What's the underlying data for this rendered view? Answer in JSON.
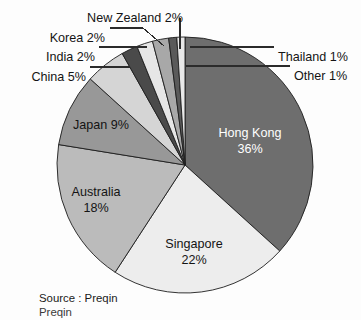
{
  "chart_data": {
    "type": "pie",
    "title": "",
    "subtitle": "",
    "xlabel": "",
    "ylabel": "",
    "legend_position": "none",
    "grid": false,
    "units": "percent",
    "start_angle_deg": 0,
    "direction": "clockwise",
    "categories": [
      "Hong Kong",
      "Singapore",
      "Australia",
      "Japan",
      "China",
      "India",
      "Korea",
      "New Zealand",
      "Thailand",
      "Other"
    ],
    "values": [
      36,
      22,
      18,
      9,
      5,
      2,
      2,
      2,
      1,
      1
    ],
    "total": 98,
    "slices": [
      {
        "name": "Hong Kong",
        "value": 36,
        "value_label": "36%",
        "label_line1": "Hong Kong",
        "label_line2": "36%",
        "color": "#6e6e6e",
        "label_placement": "inside",
        "label_color": "light"
      },
      {
        "name": "Singapore",
        "value": 22,
        "value_label": "22%",
        "label_line1": "Singapore",
        "label_line2": "22%",
        "color": "#ededed",
        "label_placement": "inside",
        "label_color": "dark"
      },
      {
        "name": "Australia",
        "value": 18,
        "value_label": "18%",
        "label_line1": "Australia",
        "label_line2": "18%",
        "color": "#bbbbbb",
        "label_placement": "inside",
        "label_color": "dark"
      },
      {
        "name": "Japan",
        "value": 9,
        "value_label": "9%",
        "label_line1": "Japan 9%",
        "label_line2": "",
        "color": "#989898",
        "label_placement": "inside",
        "label_color": "dark"
      },
      {
        "name": "China",
        "value": 5,
        "value_label": "5%",
        "label_line1": "China 5%",
        "label_line2": "",
        "color": "#d5d5d5",
        "label_placement": "callout",
        "label_color": "dark"
      },
      {
        "name": "India",
        "value": 2,
        "value_label": "2%",
        "label_line1": "India 2%",
        "label_line2": "",
        "color": "#4a4a4a",
        "label_placement": "callout",
        "label_color": "dark"
      },
      {
        "name": "Korea",
        "value": 2,
        "value_label": "2%",
        "label_line1": "Korea 2%",
        "label_line2": "",
        "color": "#e6e6e6",
        "label_placement": "callout",
        "label_color": "dark"
      },
      {
        "name": "New Zealand",
        "value": 2,
        "value_label": "2%",
        "label_line1": "New Zealand 2%",
        "label_line2": "",
        "color": "#a8a8a8",
        "label_placement": "callout",
        "label_color": "dark"
      },
      {
        "name": "Thailand",
        "value": 1,
        "value_label": "1%",
        "label_line1": "Thailand 1%",
        "label_line2": "",
        "color": "#5a5a5a",
        "label_placement": "callout",
        "label_color": "dark"
      },
      {
        "name": "Other",
        "value": 1,
        "value_label": "1%",
        "label_line1": "Other 1%",
        "label_line2": "",
        "color": "#e9e9e9",
        "label_placement": "callout",
        "label_color": "dark"
      }
    ],
    "callouts": [
      {
        "name": "New Zealand",
        "text": "New Zealand 2%",
        "text_x": 183,
        "text_y": 13,
        "anchor": "end",
        "line": [
          [
            180,
            18
          ],
          [
            180,
            49
          ]
        ]
      },
      {
        "name": "Korea",
        "text": "Korea 2%",
        "text_x": 105,
        "text_y": 33,
        "anchor": "end",
        "line": [
          [
            110,
            28
          ],
          [
            143,
            28
          ],
          [
            164,
            46
          ]
        ]
      },
      {
        "name": "India",
        "text": "India 2%",
        "text_x": 95,
        "text_y": 52,
        "anchor": "end",
        "line": [
          [
            99,
            47
          ],
          [
            147,
            47
          ]
        ]
      },
      {
        "name": "China",
        "text": "China 5%",
        "text_x": 86,
        "text_y": 72,
        "anchor": "end",
        "line": [
          [
            90,
            67
          ],
          [
            130,
            67
          ]
        ]
      },
      {
        "name": "Thailand",
        "text": "Thailand 1%",
        "text_x": 278,
        "text_y": 52,
        "anchor": "start",
        "line": [
          [
            274,
            47
          ],
          [
            190,
            47
          ]
        ]
      },
      {
        "name": "Other",
        "text": "Other 1%",
        "text_x": 294,
        "text_y": 71,
        "anchor": "start",
        "line": [
          [
            290,
            66
          ],
          [
            186,
            66
          ]
        ]
      }
    ],
    "geometry": {
      "center_x": 185,
      "center_y": 165,
      "radius": 128
    },
    "inner_labels": [
      {
        "name": "Hong Kong",
        "line1": "Hong Kong",
        "line2": "36%",
        "x": 250,
        "y": 137,
        "color": "light"
      },
      {
        "name": "Singapore",
        "line1": "Singapore",
        "line2": "22%",
        "x": 194,
        "y": 248,
        "color": "dark"
      },
      {
        "name": "Australia",
        "line1": "Australia",
        "line2": "18%",
        "x": 96,
        "y": 196,
        "color": "dark"
      },
      {
        "name": "Japan",
        "line1": "Japan 9%",
        "line2": "",
        "x": 101,
        "y": 129,
        "color": "dark"
      }
    ]
  },
  "source": {
    "line1": "Source : Preqin",
    "line2": "Preqin"
  },
  "colors": {
    "background": "#fdfdfd",
    "outline": "#1d1d1d",
    "text": "#141414"
  }
}
